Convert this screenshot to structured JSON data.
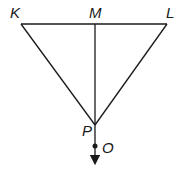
{
  "diagram": {
    "type": "geometry",
    "stroke_color": "#1a1a1a",
    "background": "#ffffff",
    "points": {
      "K": {
        "label": "K",
        "x": 21,
        "y": 24
      },
      "M": {
        "label": "M",
        "x": 95,
        "y": 24
      },
      "L": {
        "label": "L",
        "x": 167,
        "y": 24
      },
      "P": {
        "label": "P",
        "x": 95,
        "y": 125
      },
      "O": {
        "label": "O",
        "x": 95,
        "y": 146
      }
    },
    "segments": [
      {
        "from": "K",
        "to": "L"
      },
      {
        "from": "K",
        "to": "P"
      },
      {
        "from": "L",
        "to": "P"
      },
      {
        "from": "M",
        "to": "P"
      }
    ],
    "rays": [
      {
        "from": "P",
        "through": "O",
        "direction": "down"
      }
    ]
  }
}
